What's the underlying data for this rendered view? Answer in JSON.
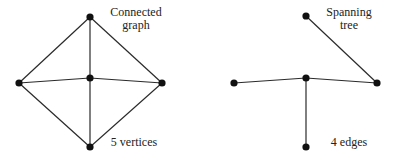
{
  "graphs": [
    {
      "name": "connected-graph",
      "title_line1": "Connected",
      "title_line2": "graph",
      "caption": "5 vertices",
      "vertices": [
        {
          "id": "top",
          "x": 90,
          "y": 17
        },
        {
          "id": "center",
          "x": 90,
          "y": 78
        },
        {
          "id": "left",
          "x": 19,
          "y": 83
        },
        {
          "id": "right",
          "x": 162,
          "y": 83
        },
        {
          "id": "bottom",
          "x": 90,
          "y": 147
        }
      ],
      "edges": [
        [
          "top",
          "left"
        ],
        [
          "top",
          "right"
        ],
        [
          "top",
          "center"
        ],
        [
          "left",
          "center"
        ],
        [
          "center",
          "right"
        ],
        [
          "center",
          "bottom"
        ],
        [
          "left",
          "bottom"
        ],
        [
          "right",
          "bottom"
        ]
      ]
    },
    {
      "name": "spanning-tree",
      "title_line1": "Spanning",
      "title_line2": "tree",
      "caption": "4 edges",
      "vertices": [
        {
          "id": "top",
          "x": 306,
          "y": 16
        },
        {
          "id": "center",
          "x": 306,
          "y": 78
        },
        {
          "id": "left",
          "x": 234,
          "y": 83
        },
        {
          "id": "right",
          "x": 377,
          "y": 83
        },
        {
          "id": "bottom",
          "x": 306,
          "y": 147
        }
      ],
      "edges": [
        [
          "top",
          "right"
        ],
        [
          "left",
          "center"
        ],
        [
          "center",
          "right"
        ],
        [
          "center",
          "bottom"
        ]
      ]
    }
  ],
  "colors": {
    "edge": "#2a2a2a",
    "vertex": "#111111",
    "text": "#222222"
  }
}
